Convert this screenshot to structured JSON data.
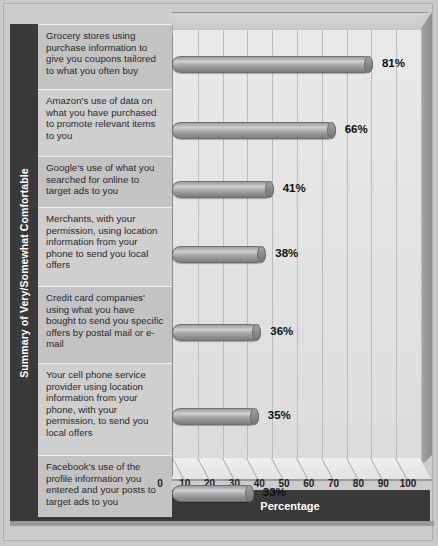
{
  "chart_data": {
    "type": "bar",
    "orientation": "horizontal",
    "title": "",
    "xlabel": "Percentage",
    "ylabel": "Summary of Very/Somewhat Comfortable",
    "xlim": [
      0,
      100
    ],
    "xticks": [
      "0",
      "10",
      "20",
      "30",
      "40",
      "50",
      "60",
      "70",
      "80",
      "90",
      "100"
    ],
    "grid": true,
    "legend": "none",
    "categories": [
      "Grocery stores using purchase information to give you coupons tailored to what you often buy",
      "Amazon's use of data on what you have purchased to promote relevant items to you",
      "Google's use of what you searched for online to target ads to you",
      "Merchants, with your permission, using location information from your phone to send you local offers",
      "Credit card companies' using what you have bought to send you specific offers by postal mail or e-mail",
      "Your cell phone service provider using location information from your phone, with your permission, to send you local offers",
      "Facebook's use of the profile information you entered and your posts to target ads to you"
    ],
    "values": [
      81,
      66,
      41,
      38,
      36,
      35,
      33
    ],
    "value_labels": [
      "81%",
      "66%",
      "41%",
      "38%",
      "36%",
      "35%",
      "33%"
    ],
    "colors": {
      "bar": "#9a9a9a",
      "plot_background": "#e4e4e4",
      "frame": "#3a3a3a",
      "page_background": "#c9c9c9",
      "gridline": "#bcbcbc",
      "label_panel": "#c6c6c6",
      "value_text": "#111111",
      "axis_title_text": "#ffffff"
    }
  }
}
